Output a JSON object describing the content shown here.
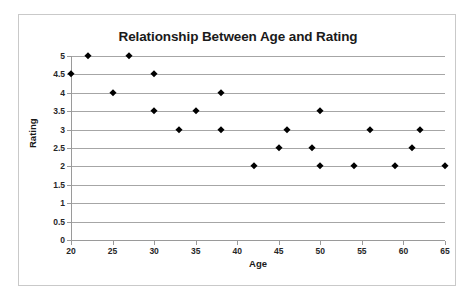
{
  "chart_data": {
    "type": "scatter",
    "title": "Relationship Between Age and Rating",
    "xlabel": "Age",
    "ylabel": "Rating",
    "xlim": [
      20,
      65
    ],
    "ylim": [
      0,
      5
    ],
    "xticks": [
      20,
      25,
      30,
      35,
      40,
      45,
      50,
      55,
      60,
      65
    ],
    "yticks": [
      0,
      0.5,
      1,
      1.5,
      2,
      2.5,
      3,
      3.5,
      4,
      4.5,
      5
    ],
    "xtick_labels": [
      "20",
      "25",
      "30",
      "35",
      "40",
      "45",
      "50",
      "55",
      "60",
      "65"
    ],
    "ytick_labels": [
      "0",
      "0.5",
      "1",
      "1.5",
      "2",
      "2.5",
      "3",
      "3.5",
      "4",
      "4.5",
      "5"
    ],
    "grid": "horizontal",
    "legend": "none",
    "marker": "diamond",
    "marker_color": "#000000",
    "gridline_color": "#a6a6a6",
    "points": [
      {
        "x": 20,
        "y": 4.5
      },
      {
        "x": 22,
        "y": 5
      },
      {
        "x": 25,
        "y": 4
      },
      {
        "x": 27,
        "y": 5
      },
      {
        "x": 30,
        "y": 4.5
      },
      {
        "x": 30,
        "y": 3.5
      },
      {
        "x": 33,
        "y": 3
      },
      {
        "x": 35,
        "y": 3.5
      },
      {
        "x": 38,
        "y": 4
      },
      {
        "x": 38,
        "y": 3
      },
      {
        "x": 42,
        "y": 2
      },
      {
        "x": 45,
        "y": 2.5
      },
      {
        "x": 46,
        "y": 3
      },
      {
        "x": 49,
        "y": 2.5
      },
      {
        "x": 50,
        "y": 3.5
      },
      {
        "x": 50,
        "y": 2
      },
      {
        "x": 54,
        "y": 2
      },
      {
        "x": 56,
        "y": 3
      },
      {
        "x": 59,
        "y": 2
      },
      {
        "x": 61,
        "y": 2.5
      },
      {
        "x": 62,
        "y": 3
      },
      {
        "x": 65,
        "y": 2
      }
    ]
  }
}
